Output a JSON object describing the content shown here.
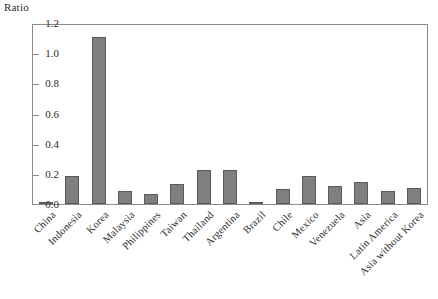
{
  "chart_data": {
    "type": "bar",
    "title": "",
    "ylabel": "Ratio",
    "xlabel": "",
    "ylim": [
      0.0,
      1.2
    ],
    "yticks": [
      "0.0",
      "0.2",
      "0.4",
      "0.6",
      "0.8",
      "1.0",
      "1.2"
    ],
    "ytick_values": [
      0.0,
      0.2,
      0.4,
      0.6,
      0.8,
      1.0,
      1.2
    ],
    "grid": false,
    "legend": null,
    "bar_color": "#7f7f7f",
    "bar_edge_color": "#5a5a5a",
    "categories": [
      "China",
      "Indonesia",
      "Korea",
      "Malaysia",
      "Philippines",
      "Taiwan",
      "Thailand",
      "Argentina",
      "Brazil",
      "Chile",
      "Mexico",
      "Venezuela",
      "Asia",
      "Latin America",
      "Asia without Korea"
    ],
    "values": [
      0.015,
      0.19,
      1.12,
      0.09,
      0.07,
      0.135,
      0.23,
      0.23,
      0.015,
      0.1,
      0.19,
      0.12,
      0.15,
      0.085,
      0.105
    ]
  }
}
